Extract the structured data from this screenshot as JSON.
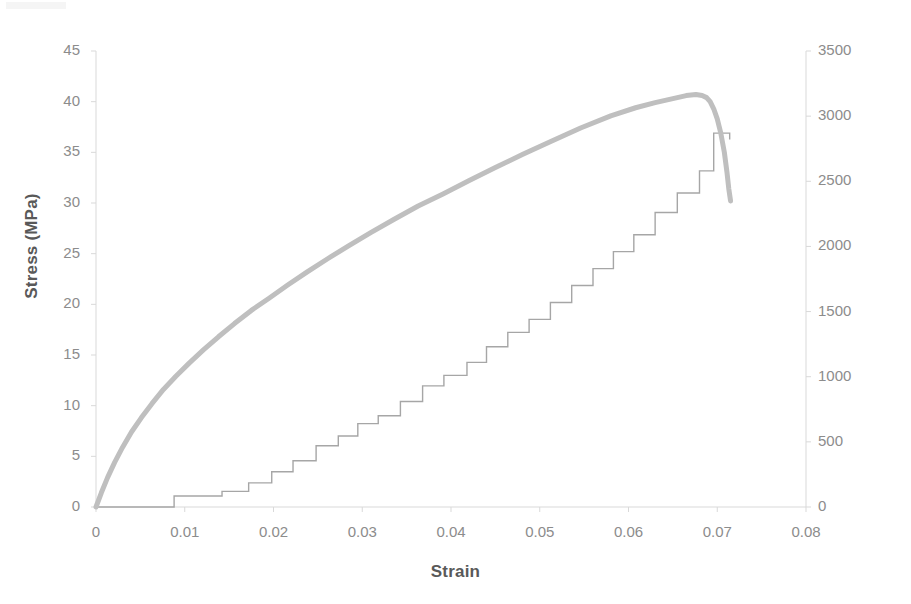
{
  "chart_data": {
    "type": "line",
    "title": "",
    "xlabel": "Strain",
    "ylabel": "Stress (MPa)",
    "y2label": "Cumulative number of beats",
    "xlim": [
      0,
      0.08
    ],
    "ylim": [
      0,
      45
    ],
    "y2lim": [
      0,
      3500
    ],
    "grid": false,
    "legend": "none",
    "xticks": [
      "0",
      "0.01",
      "0.02",
      "0.03",
      "0.04",
      "0.05",
      "0.06",
      "0.07",
      "0.08"
    ],
    "xtick_values": [
      0,
      0.01,
      0.02,
      0.03,
      0.04,
      0.05,
      0.06,
      0.07,
      0.08
    ],
    "yticks": [
      "0",
      "5",
      "10",
      "15",
      "20",
      "25",
      "30",
      "35",
      "40",
      "45"
    ],
    "ytick_values": [
      0,
      5,
      10,
      15,
      20,
      25,
      30,
      35,
      40,
      45
    ],
    "y2ticks": [
      "0",
      "500",
      "1000",
      "1500",
      "2000",
      "2500",
      "3000",
      "3500"
    ],
    "y2tick_values": [
      0,
      500,
      1000,
      1500,
      2000,
      2500,
      3000,
      3500
    ],
    "colors": {
      "stress_curve": "#bfbfbf",
      "beats_curve": "#a6a6a6",
      "axis": "#d9d9d9",
      "tick_text": "#8c8c8c",
      "title_text": "#595959"
    },
    "series": [
      {
        "name": "Stress (MPa)",
        "axis": "left",
        "type": "line",
        "linewidth": 5,
        "color": "#bfbfbf",
        "x": [
          0,
          0.0006,
          0.0013,
          0.0021,
          0.003,
          0.004,
          0.0051,
          0.0063,
          0.0076,
          0.009,
          0.0105,
          0.0121,
          0.0138,
          0.0156,
          0.0175,
          0.0195,
          0.0216,
          0.0238,
          0.0261,
          0.0285,
          0.031,
          0.0336,
          0.0363,
          0.0391,
          0.042,
          0.045,
          0.0481,
          0.0513,
          0.0546,
          0.058,
          0.0608,
          0.063,
          0.065,
          0.0665,
          0.0676,
          0.0683,
          0.0688,
          0.0692,
          0.0696,
          0.07,
          0.0704,
          0.0708,
          0.0711,
          0.0713,
          0.0715
        ],
        "y": [
          0,
          1.4,
          2.9,
          4.4,
          5.9,
          7.4,
          8.8,
          10.2,
          11.6,
          12.9,
          14.2,
          15.5,
          16.8,
          18.1,
          19.4,
          20.6,
          21.9,
          23.2,
          24.5,
          25.8,
          27.1,
          28.4,
          29.7,
          30.9,
          32.2,
          33.5,
          34.8,
          36.1,
          37.4,
          38.6,
          39.4,
          39.9,
          40.3,
          40.6,
          40.7,
          40.6,
          40.4,
          40.0,
          39.3,
          38.3,
          36.9,
          35.0,
          33.0,
          31.4,
          30.2
        ]
      },
      {
        "name": "Cumulative number of beats",
        "axis": "right",
        "type": "step",
        "linewidth": 1.4,
        "color": "#a6a6a6",
        "x": [
          0,
          0.0088,
          0.0088,
          0.0142,
          0.0142,
          0.0172,
          0.0172,
          0.0198,
          0.0198,
          0.0222,
          0.0222,
          0.0248,
          0.0248,
          0.0273,
          0.0273,
          0.0295,
          0.0295,
          0.0318,
          0.0318,
          0.0343,
          0.0343,
          0.0368,
          0.0368,
          0.0392,
          0.0392,
          0.0418,
          0.0418,
          0.044,
          0.044,
          0.0464,
          0.0464,
          0.0488,
          0.0488,
          0.0512,
          0.0512,
          0.0536,
          0.0536,
          0.056,
          0.056,
          0.0583,
          0.0583,
          0.0606,
          0.0606,
          0.063,
          0.063,
          0.0655,
          0.0655,
          0.068,
          0.068,
          0.0696,
          0.0696,
          0.0714,
          0.0714
        ],
        "y": [
          0,
          0,
          85,
          85,
          120,
          120,
          185,
          185,
          270,
          270,
          355,
          355,
          470,
          470,
          545,
          545,
          640,
          640,
          700,
          700,
          810,
          810,
          930,
          930,
          1010,
          1010,
          1110,
          1110,
          1230,
          1230,
          1340,
          1340,
          1440,
          1440,
          1570,
          1570,
          1700,
          1700,
          1830,
          1830,
          1960,
          1960,
          2090,
          2090,
          2260,
          2260,
          2410,
          2410,
          2580,
          2580,
          2870,
          2870,
          2820
        ]
      }
    ]
  },
  "axes": {
    "left_title": "Stress (MPa)",
    "right_title": "Cumulative number of beats",
    "x_title": "Strain"
  }
}
